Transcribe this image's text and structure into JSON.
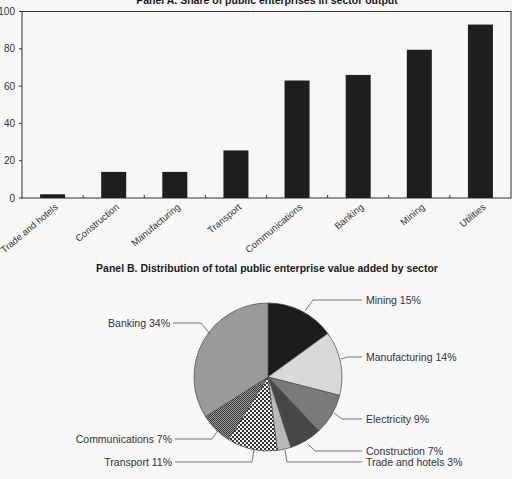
{
  "chart_data": [
    {
      "type": "bar",
      "title": "Panel A. Share of public enterprises in sector output",
      "xlabel": "",
      "ylabel": "",
      "ylim": [
        0,
        100
      ],
      "yticks": [
        0,
        20,
        40,
        60,
        80,
        100
      ],
      "grid": false,
      "categories": [
        "Trade and hotels",
        "Construction",
        "Manufacturing",
        "Transport",
        "Communications",
        "Banking",
        "Mining",
        "Utilities"
      ],
      "values": [
        2,
        14,
        14,
        25.5,
        63,
        66,
        79.5,
        93
      ],
      "bar_color": "#1e1e1e"
    },
    {
      "type": "pie",
      "title": "Panel B. Distribution of total public enterprise value added by sector",
      "start": "12 o'clock, clockwise",
      "slices": [
        {
          "label": "Mining",
          "value": 15,
          "text": "Mining 15%",
          "fill": "#1c1c1c"
        },
        {
          "label": "Manufacturing",
          "value": 14,
          "text": "Manufacturing 14%",
          "fill": "#d9d9d9"
        },
        {
          "label": "Electricity",
          "value": 9,
          "text": "Electricity 9%",
          "fill": "#7a7a7a"
        },
        {
          "label": "Construction",
          "value": 7,
          "text": "Construction 7%",
          "fill": "#474747"
        },
        {
          "label": "Trade and hotels",
          "value": 3,
          "text": "Trade and hotels 3%",
          "fill": "#b8b8b8"
        },
        {
          "label": "Transport",
          "value": 11,
          "text": "Transport 11%",
          "fill": "pattern-checker-coarse"
        },
        {
          "label": "Communications",
          "value": 7,
          "text": "Communications 7%",
          "fill": "pattern-checker-fine"
        },
        {
          "label": "Banking",
          "value": 34,
          "text": "Banking 34%",
          "fill": "#9a9a9a"
        }
      ]
    }
  ]
}
